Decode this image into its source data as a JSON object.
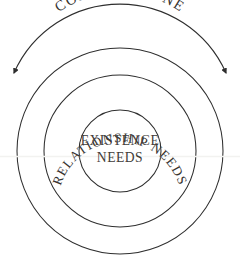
{
  "diagram": {
    "type": "concentric-circles",
    "background_color": "#ffffff",
    "stroke_color": "#2e2e2e",
    "outer_label": "COMFORT ZONE",
    "rings": [
      {
        "name": "outer-ring",
        "label": "",
        "fill_color": "#ffffff",
        "radius": 103
      },
      {
        "name": "middle-ring",
        "label": "RELATIONSHIP NEEDS",
        "fill_color": "#eceae7",
        "radius": 76
      },
      {
        "name": "inner-circle",
        "label_line_1": "EXISTENCE",
        "label_line_2": "NEEDS",
        "fill_color": "#ffffff",
        "radius": 41
      }
    ],
    "arrow": {
      "name": "comfort-zone-span-arrow",
      "style": "double-headed-arc",
      "color": "#2e2e2e"
    }
  }
}
